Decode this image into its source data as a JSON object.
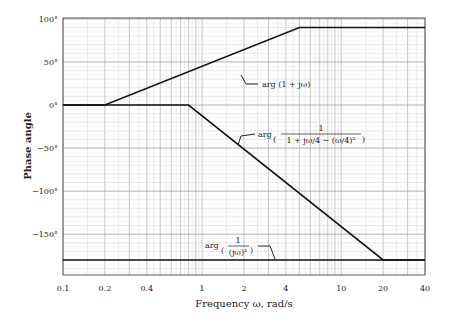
{
  "chart_data": {
    "type": "line",
    "title": "",
    "xlabel": "Frequency ω, rad/s",
    "ylabel": "Phase angle",
    "xscale": "log",
    "xlim": [
      0.1,
      40
    ],
    "ylim": [
      -197,
      100
    ],
    "grid": true,
    "x_ticks": [
      "0.1",
      "0.2",
      "0.4",
      "1",
      "2",
      "4",
      "10",
      "20",
      "40"
    ],
    "y_ticks": [
      "100°",
      "50°",
      "0°",
      "−50°",
      "−100°",
      "−150°"
    ],
    "series": [
      {
        "name": "arg (1 + jω)",
        "x": [
          0.1,
          0.2,
          5,
          40
        ],
        "y": [
          0,
          0,
          90,
          90
        ]
      },
      {
        "name": "arg (1 / (1 + jω/4 − (ω/4)²))",
        "x": [
          0.1,
          0.8,
          20,
          40
        ],
        "y": [
          0,
          0,
          -180,
          -180
        ]
      },
      {
        "name": "arg (1 / (jω)²)",
        "x": [
          0.1,
          40
        ],
        "y": [
          -180,
          -180
        ]
      }
    ],
    "annotations": [
      {
        "text": "arg (1 + jω)",
        "points_to_x": 1.5
      },
      {
        "text": "arg ( 1 / (1 + jω/4 − (ω/4)²) )",
        "points_to_x": 2.2
      },
      {
        "text": "arg ( 1 / (jω)² )",
        "points_to_x": 3.6
      }
    ]
  },
  "labels": {
    "ylabel": "Phase angle",
    "xlabel": "Frequency ω, rad/s",
    "ann1": "arg (1 + jω)",
    "ann2_prefix": "arg",
    "ann2_num": "1",
    "ann2_den": "1 + jω/4 − (ω/4)²",
    "ann3_prefix": "arg",
    "ann3_num": "1",
    "ann3_den": "(jω)²"
  }
}
